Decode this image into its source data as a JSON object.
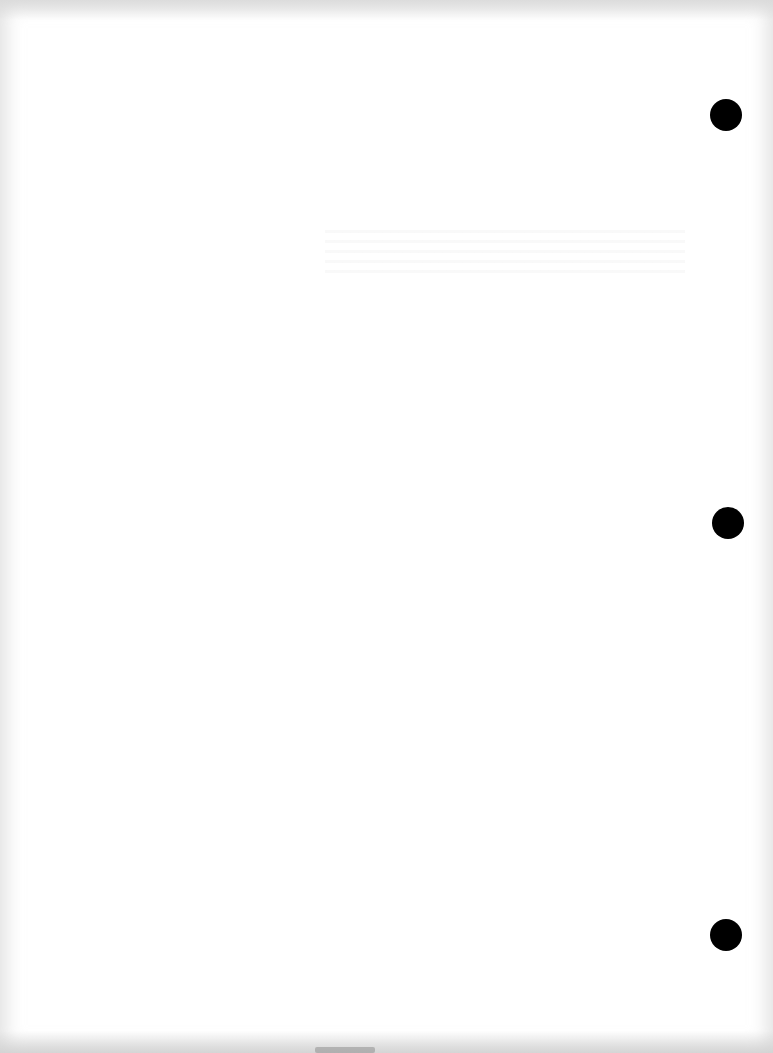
{
  "document": {
    "type": "blank scanned page",
    "text_content": "",
    "punch_holes": [
      {
        "position": "top",
        "cx": 726,
        "cy": 115
      },
      {
        "position": "middle",
        "cx": 728,
        "cy": 523
      },
      {
        "position": "bottom",
        "cx": 726,
        "cy": 935
      }
    ],
    "colors": {
      "paper": "#ffffff",
      "hole": "#000000",
      "edge_shadow": "#d0d0d0"
    }
  }
}
